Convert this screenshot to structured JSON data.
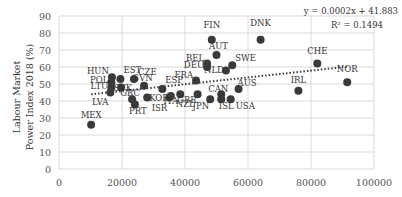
{
  "chart_data": {
    "type": "scatter",
    "title": "",
    "xlabel": "",
    "ylabel": "Labour Market Power Index 2018 (%)",
    "ylabel_lines": [
      "Labour Market",
      "Power Index 2018 (%)"
    ],
    "xlim": [
      0,
      100000
    ],
    "ylim": [
      0,
      90
    ],
    "x_ticks": [
      0,
      20000,
      40000,
      60000,
      80000,
      100000
    ],
    "y_ticks": [
      0,
      10,
      20,
      30,
      40,
      50,
      60,
      70,
      80,
      90
    ],
    "grid": true,
    "trendline": {
      "type": "linear",
      "slope": 0.0002,
      "intercept": 41.883,
      "style": "dotted",
      "equation": "y = 0.0002x + 41.883",
      "r_squared": "R² = 0.1494"
    },
    "points": [
      {
        "label": "MEX",
        "x": 10200,
        "y": 26
      },
      {
        "label": "LVA",
        "x": 16300,
        "y": 45
      },
      {
        "label": "LTU",
        "x": 16600,
        "y": 48
      },
      {
        "label": "POL",
        "x": 16600,
        "y": 51
      },
      {
        "label": "HUN",
        "x": 16800,
        "y": 54
      },
      {
        "label": "SVK",
        "x": 19700,
        "y": 48
      },
      {
        "label": "EST",
        "x": 19500,
        "y": 53
      },
      {
        "label": "CZE",
        "x": 23800,
        "y": 53
      },
      {
        "label": "GRC",
        "x": 23200,
        "y": 41
      },
      {
        "label": "PRT",
        "x": 24100,
        "y": 38
      },
      {
        "label": "SVN",
        "x": 27000,
        "y": 49
      },
      {
        "label": "KOR",
        "x": 28000,
        "y": 42
      },
      {
        "label": "ESP",
        "x": 32800,
        "y": 47
      },
      {
        "label": "ISR",
        "x": 35000,
        "y": 42
      },
      {
        "label": "ITA",
        "x": 35500,
        "y": 43
      },
      {
        "label": "NZL",
        "x": 38500,
        "y": 44
      },
      {
        "label": "GBR",
        "x": 44000,
        "y": 44
      },
      {
        "label": "FRA",
        "x": 43500,
        "y": 52
      },
      {
        "label": "DEU",
        "x": 47000,
        "y": 60
      },
      {
        "label": "BEL",
        "x": 47000,
        "y": 62
      },
      {
        "label": "FIN",
        "x": 48500,
        "y": 76
      },
      {
        "label": "AUT",
        "x": 50000,
        "y": 67
      },
      {
        "label": "NLD",
        "x": 53000,
        "y": 58
      },
      {
        "label": "SWE",
        "x": 55000,
        "y": 61
      },
      {
        "label": "CAN",
        "x": 51500,
        "y": 44
      },
      {
        "label": "JPN",
        "x": 48000,
        "y": 41
      },
      {
        "label": "ISL",
        "x": 51500,
        "y": 41
      },
      {
        "label": "USA",
        "x": 54500,
        "y": 41
      },
      {
        "label": "AUS",
        "x": 57000,
        "y": 47
      },
      {
        "label": "DNK",
        "x": 64000,
        "y": 76
      },
      {
        "label": "IRL",
        "x": 76000,
        "y": 46
      },
      {
        "label": "CHE",
        "x": 82000,
        "y": 62
      },
      {
        "label": "NOR",
        "x": 91500,
        "y": 51
      }
    ]
  },
  "colors": {
    "point": "#3a3a3a",
    "grid": "#d9d9d9",
    "trend": "#3a3a3a"
  }
}
